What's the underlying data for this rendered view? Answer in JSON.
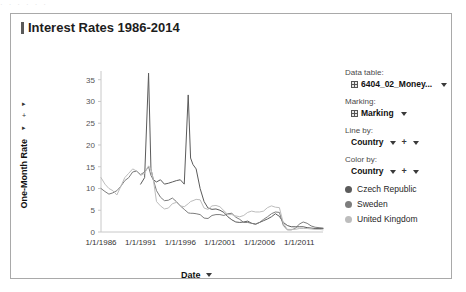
{
  "scan_artifact": "· ·    · ·      ·   ·",
  "title": {
    "text": "Interest Rates 1986-2014",
    "icon": "bar-mark-icon"
  },
  "y_axis_selector": {
    "arrow_top": "▸",
    "plus": "+",
    "arrow_bottom": "▸",
    "title": "One-Month Rate"
  },
  "x_axis": {
    "title": "Date",
    "dropdown_icon": "chevron-down-icon"
  },
  "panel": {
    "data_table_label": "Data table:",
    "data_table_value": "6404_02_Money...",
    "marking_label": "Marking:",
    "marking_value": "Marking",
    "line_by_label": "Line by:",
    "line_by_value": "Country",
    "color_by_label": "Color by:",
    "color_by_value": "Country",
    "plus_symbol": "+"
  },
  "legend": {
    "items": [
      {
        "label": "Czech Republic",
        "color": "#5b5b5b"
      },
      {
        "label": "Sweden",
        "color": "#7d7d7d"
      },
      {
        "label": "United Kingdom",
        "color": "#bdbdbd"
      }
    ]
  },
  "chart_data": {
    "type": "line",
    "title": "Interest Rates 1986-2014",
    "xlabel": "Date",
    "ylabel": "One-Month Rate",
    "ylim": [
      0,
      37
    ],
    "yticks": [
      0,
      5,
      10,
      15,
      20,
      25,
      30,
      35
    ],
    "xticks": [
      "1/1/1986",
      "1/1/1991",
      "1/1/1996",
      "1/1/2001",
      "1/1/2006",
      "1/1/2011"
    ],
    "xlim": [
      "1986-01-01",
      "2014-01-01"
    ],
    "grid": false,
    "legend_position": "right",
    "x": [
      1986.0,
      1986.5,
      1987.0,
      1987.5,
      1988.0,
      1988.5,
      1989.0,
      1989.5,
      1990.0,
      1990.5,
      1991.0,
      1991.5,
      1992.0,
      1992.3,
      1992.6,
      1993.0,
      1993.5,
      1994.0,
      1994.5,
      1995.0,
      1995.5,
      1996.0,
      1996.5,
      1997.0,
      1997.3,
      1997.6,
      1998.0,
      1998.5,
      1999.0,
      1999.5,
      2000.0,
      2000.5,
      2001.0,
      2001.5,
      2002.0,
      2002.5,
      2003.0,
      2003.5,
      2004.0,
      2004.5,
      2005.0,
      2005.5,
      2006.0,
      2006.5,
      2007.0,
      2007.5,
      2008.0,
      2008.5,
      2009.0,
      2009.5,
      2010.0,
      2010.5,
      2011.0,
      2011.5,
      2012.0,
      2012.5,
      2013.0,
      2013.5,
      2014.0
    ],
    "series": [
      {
        "name": "Czech Republic",
        "color": "#5b5b5b",
        "values": [
          null,
          null,
          null,
          null,
          null,
          null,
          null,
          null,
          null,
          null,
          11.0,
          12.5,
          36.5,
          14.5,
          12.0,
          11.5,
          12.0,
          11.0,
          11.2,
          11.5,
          11.8,
          12.0,
          11.0,
          31.5,
          17.0,
          15.5,
          14.5,
          10.0,
          7.0,
          5.5,
          5.2,
          5.3,
          5.0,
          4.5,
          3.5,
          2.8,
          2.3,
          2.2,
          2.3,
          2.5,
          2.0,
          1.8,
          2.2,
          2.6,
          3.0,
          3.5,
          4.2,
          3.6,
          2.2,
          1.5,
          1.2,
          1.2,
          1.2,
          1.2,
          1.0,
          0.9,
          0.8,
          0.8,
          0.8
        ]
      },
      {
        "name": "Sweden",
        "color": "#7d7d7d",
        "values": [
          10.0,
          9.3,
          8.7,
          9.0,
          9.5,
          10.5,
          11.8,
          12.5,
          13.8,
          14.0,
          13.2,
          13.8,
          15.0,
          13.0,
          12.0,
          9.5,
          8.0,
          7.2,
          7.3,
          7.8,
          7.0,
          6.0,
          5.2,
          4.4,
          4.3,
          4.3,
          4.2,
          4.0,
          3.2,
          3.1,
          3.8,
          4.0,
          4.0,
          3.8,
          4.2,
          4.3,
          3.4,
          2.9,
          2.2,
          2.2,
          2.0,
          1.8,
          2.2,
          2.9,
          3.5,
          4.2,
          4.6,
          4.5,
          1.5,
          0.5,
          0.5,
          0.8,
          1.8,
          2.3,
          2.0,
          1.4,
          1.1,
          1.0,
          0.9
        ]
      },
      {
        "name": "United Kingdom",
        "color": "#bdbdbd",
        "values": [
          12.5,
          11.0,
          10.0,
          9.5,
          8.5,
          10.5,
          12.5,
          13.5,
          14.5,
          14.0,
          13.0,
          13.5,
          15.2,
          14.5,
          12.0,
          7.0,
          6.0,
          5.3,
          5.5,
          6.5,
          6.8,
          6.0,
          5.8,
          6.5,
          7.0,
          7.2,
          7.5,
          7.4,
          5.5,
          5.2,
          6.0,
          6.1,
          5.8,
          4.9,
          4.0,
          4.0,
          3.7,
          3.5,
          3.8,
          4.5,
          4.8,
          4.6,
          4.6,
          4.8,
          5.6,
          6.0,
          5.7,
          5.6,
          2.0,
          0.6,
          0.6,
          0.6,
          0.8,
          0.8,
          0.8,
          0.7,
          0.6,
          0.6,
          0.5
        ]
      }
    ]
  }
}
